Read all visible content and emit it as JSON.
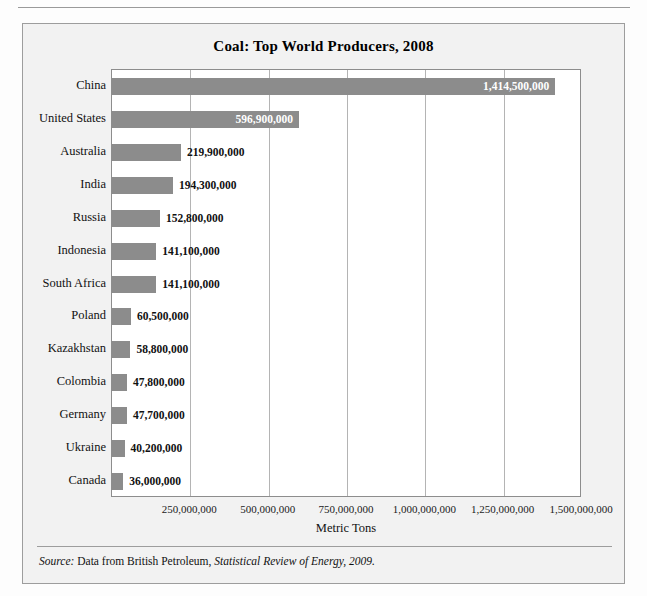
{
  "chart_data": {
    "type": "bar",
    "orientation": "horizontal",
    "title": "Coal: Top World Producers, 2008",
    "xlabel": "Metric Tons",
    "ylabel": "",
    "xlim": [
      0,
      1500000000
    ],
    "grid": true,
    "legend": null,
    "categories": [
      "China",
      "United States",
      "Australia",
      "India",
      "Russia",
      "Indonesia",
      "South Africa",
      "Poland",
      "Kazakhstan",
      "Colombia",
      "Germany",
      "Ukraine",
      "Canada"
    ],
    "values": [
      1414500000,
      596900000,
      219900000,
      194300000,
      152800000,
      141100000,
      141100000,
      60500000,
      58800000,
      47800000,
      47700000,
      40200000,
      36000000
    ],
    "value_labels": [
      "1,414,500,000",
      "596,900,000",
      "219,900,000",
      "194,300,000",
      "152,800,000",
      "141,100,000",
      "141,100,000",
      "60,500,000",
      "58,800,000",
      "47,800,000",
      "47,700,000",
      "40,200,000",
      "36,000,000"
    ],
    "label_placement": [
      "inside",
      "inside",
      "outside",
      "outside",
      "outside",
      "outside",
      "outside",
      "outside",
      "outside",
      "outside",
      "outside",
      "outside",
      "outside"
    ],
    "xticks": [
      250000000,
      500000000,
      750000000,
      1000000000,
      1250000000,
      1500000000
    ],
    "xtick_labels": [
      "250,000,000",
      "500,000,000",
      "750,000,000",
      "1,000,000,000",
      "1,250,000,000",
      "1,500,000,000"
    ],
    "bar_color": "#8c8c8c",
    "plot_background": "#ffffff",
    "gridline_color": "#b4b4b4",
    "inside_label_color": "#ffffff",
    "outside_label_color": "#111111"
  },
  "figure": {
    "background": "#f2f2f2",
    "border_color": "#9d9d9d"
  },
  "source": {
    "prefix": "Source:",
    "text": " Data from British Petroleum, ",
    "publication": "Statistical Review of Energy, 2009."
  }
}
